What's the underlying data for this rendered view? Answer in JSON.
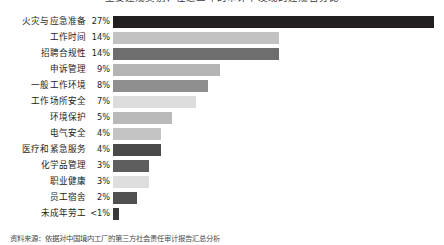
{
  "chart_data": {
    "type": "bar",
    "orientation": "horizontal",
    "title": "主要违规类别：在近三年的审计中发现的违规百分比",
    "subtitle": "",
    "xlabel": "",
    "ylabel": "",
    "xlim": [
      0,
      27
    ],
    "grid": false,
    "legend": null,
    "categories": [
      "火灾与应急准备",
      "工作时间",
      "招聘合规性",
      "申诉管理",
      "一般工作环境",
      "工作场所安全",
      "环境保护",
      "电气安全",
      "医疗和紧急服务",
      "化学品管理",
      "职业健康",
      "员工宿舍",
      "未成年劳工"
    ],
    "values": [
      27,
      14,
      14,
      9,
      8,
      7,
      5,
      4,
      4,
      3,
      3,
      2,
      0.5
    ],
    "value_labels": [
      "27%",
      "14%",
      "14%",
      "9%",
      "8%",
      "7%",
      "5%",
      "4%",
      "4%",
      "3%",
      "3%",
      "2%",
      "<1%"
    ],
    "bar_colors": [
      "#231f20",
      "#c2c2c2",
      "#6e6e6e",
      "#b4b4b4",
      "#8f8f8f",
      "#dcdcdc",
      "#b9b9b9",
      "#c4c4c4",
      "#4a4a4a",
      "#5e5e5e",
      "#dedede",
      "#505050",
      "#3a3a3a"
    ],
    "annotations": []
  },
  "footer": {
    "source": "资料来源：依据对中国境内工厂的第三方社会责任审计报告汇总分析"
  }
}
